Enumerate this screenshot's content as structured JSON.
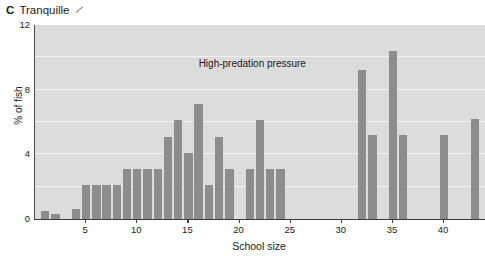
{
  "figure": {
    "panel_letter": "C",
    "panel_title": "Tranquille",
    "title_mark_icon": "tick-mark-icon"
  },
  "chart_data": {
    "type": "bar",
    "title": "Tranquille",
    "xlabel": "School size",
    "ylabel": "% of fish",
    "xlim": [
      0,
      44
    ],
    "ylim": [
      0,
      12
    ],
    "yticks": [
      0,
      4,
      8,
      12
    ],
    "xticks": [
      5,
      10,
      15,
      20,
      25,
      30,
      35,
      40
    ],
    "gridlines": [
      2,
      4,
      6,
      8,
      10
    ],
    "grid": true,
    "legend": "none",
    "annotations": [
      {
        "text": "High-predation pressure",
        "x": 16,
        "y": 9.6
      }
    ],
    "bar_color": "#8d8d8d",
    "plot_background": "#dcdcdc",
    "categories": [
      1,
      2,
      3,
      4,
      5,
      6,
      7,
      8,
      9,
      10,
      11,
      12,
      13,
      14,
      15,
      16,
      17,
      18,
      19,
      20,
      21,
      22,
      23,
      24,
      25,
      26,
      27,
      28,
      29,
      30,
      31,
      32,
      33,
      34,
      35,
      36,
      37,
      38,
      39,
      40,
      41,
      42,
      43
    ],
    "values": [
      0.5,
      0.3,
      0.0,
      0.6,
      2.1,
      2.1,
      2.1,
      2.1,
      3.1,
      3.1,
      3.1,
      3.1,
      5.1,
      6.1,
      4.1,
      7.1,
      2.1,
      5.1,
      3.1,
      0.0,
      3.1,
      6.1,
      3.1,
      3.1,
      0.0,
      0.0,
      0.0,
      0.0,
      0.0,
      0.0,
      0.0,
      9.2,
      5.2,
      0.0,
      10.4,
      5.2,
      0.0,
      0.0,
      0.0,
      5.2,
      0.0,
      0.0,
      6.2
    ]
  },
  "axes": {
    "y_tick_labels": [
      "12",
      "8",
      "4",
      "0"
    ],
    "x_tick_labels": [
      "5",
      "10",
      "15",
      "20",
      "25",
      "30",
      "35",
      "40"
    ]
  }
}
